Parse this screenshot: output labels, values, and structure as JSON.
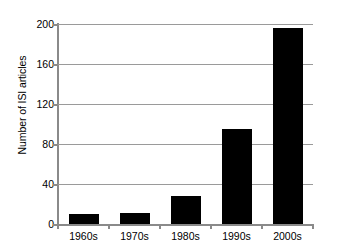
{
  "chart_data": {
    "type": "bar",
    "title": "",
    "subtitle": "",
    "xlabel": "",
    "ylabel": "Number of ISI articles",
    "categories": [
      "1960s",
      "1970s",
      "1980s",
      "1990s",
      "2000s"
    ],
    "values": [
      10,
      11,
      28,
      95,
      196
    ],
    "ylim": [
      0,
      200
    ],
    "yticks": [
      0,
      40,
      80,
      120,
      160,
      200
    ],
    "ytick_labels": [
      "0",
      "40",
      "80",
      "120",
      "160",
      "200"
    ],
    "grid": "horizontal",
    "legend": "none",
    "bar_color": "#000000",
    "axis_color": "#8a8a8a",
    "grid_color": "#9a9a9a",
    "background": "#ffffff"
  }
}
